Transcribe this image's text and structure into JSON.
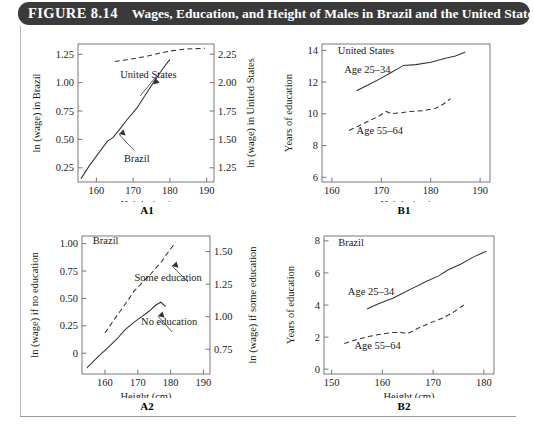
{
  "figure": {
    "number_label": "FIGURE 8.14",
    "caption": "Wages, Education, and Height of Males in Brazil and the United States"
  },
  "panels": {
    "a1": {
      "tag": "A1"
    },
    "b1": {
      "tag": "B1"
    },
    "a2": {
      "tag": "A2"
    },
    "b2": {
      "tag": "B2"
    }
  },
  "chart_data": [
    {
      "id": "A1",
      "type": "line",
      "title": "",
      "panel_label": "A1",
      "xlabel": "Height (cm)",
      "ylabel": "ln (wage) in Brazil",
      "y2label": "ln (wage) in United States",
      "xlim": [
        155,
        192
      ],
      "ylim": [
        0.125,
        1.34
      ],
      "y2lim": [
        1.125,
        2.34
      ],
      "xticks": [
        160,
        170,
        180,
        190
      ],
      "yticks": [
        0.25,
        0.5,
        0.75,
        1.0,
        1.25
      ],
      "ytick_labels": [
        "0.25",
        "0.50",
        "0.75",
        "1.00",
        "1.25"
      ],
      "y2ticks": [
        1.25,
        1.5,
        1.75,
        2.0,
        2.25
      ],
      "y2tick_labels": [
        "1.25",
        "1.50",
        "1.75",
        "2.00",
        "2.25"
      ],
      "grid": false,
      "legend_position": "inline-annotations",
      "annotations": [
        {
          "text": "United States",
          "x": 166.5,
          "y": 1.04,
          "axis": "left"
        },
        {
          "text": "Brazil",
          "x": 167.5,
          "y": 0.3,
          "axis": "left"
        }
      ],
      "series": [
        {
          "name": "Brazil",
          "axis": "left",
          "style": "solid",
          "x": [
            155.8,
            158.0,
            160.5,
            163.0,
            164.5,
            166.0,
            168.5,
            171.0,
            173.0,
            175.5,
            178.0,
            180.0
          ],
          "values": [
            0.155,
            0.265,
            0.375,
            0.485,
            0.515,
            0.575,
            0.68,
            0.775,
            0.875,
            1.0,
            1.12,
            1.205
          ]
        },
        {
          "name": "United States",
          "axis": "right",
          "style": "dashed",
          "x": [
            165.0,
            168.0,
            171.0,
            174.0,
            177.0,
            180.0,
            183.0,
            186.0,
            189.5
          ],
          "values": [
            2.185,
            2.2,
            2.215,
            2.235,
            2.258,
            2.278,
            2.292,
            2.298,
            2.302
          ]
        }
      ]
    },
    {
      "id": "B1",
      "type": "line",
      "panel_label": "B1",
      "country": "United States",
      "xlabel": "Height (cm)",
      "ylabel": "Years of education",
      "xlim": [
        158,
        192
      ],
      "ylim": [
        5.7,
        14.4
      ],
      "xticks": [
        160,
        170,
        180,
        190
      ],
      "yticks": [
        6,
        8,
        10,
        12,
        14
      ],
      "ytick_labels": [
        "6",
        "8",
        "10",
        "12",
        "14"
      ],
      "grid": false,
      "legend_position": "inline-annotations",
      "annotations": [
        {
          "text": "United States",
          "x": 161.2,
          "y": 13.75
        },
        {
          "text": "Age 25–34",
          "x": 162.5,
          "y": 12.55
        },
        {
          "text": "Age 55–64",
          "x": 165.0,
          "y": 8.75
        }
      ],
      "series": [
        {
          "name": "Age 25–34",
          "style": "solid",
          "x": [
            165.0,
            167.5,
            170.0,
            172.0,
            174.5,
            177.0,
            180.0,
            183.0,
            185.0,
            187.0
          ],
          "values": [
            11.45,
            11.85,
            12.25,
            12.6,
            13.05,
            13.1,
            13.25,
            13.5,
            13.65,
            13.9
          ]
        },
        {
          "name": "Age 55–64",
          "style": "dashed",
          "x": [
            163.5,
            165.5,
            167.5,
            169.5,
            171.0,
            172.0,
            173.5,
            176.0,
            178.5,
            181.0,
            182.5,
            184.0
          ],
          "values": [
            8.95,
            9.25,
            9.55,
            9.85,
            10.15,
            10.0,
            10.05,
            10.15,
            10.2,
            10.35,
            10.6,
            10.95
          ]
        }
      ]
    },
    {
      "id": "A2",
      "type": "line",
      "panel_label": "A2",
      "country": "Brazil",
      "xlabel": "Height (cm)",
      "ylabel": "ln (wage) if no education",
      "y2label": "ln (wage) if some education",
      "xlim": [
        153,
        192
      ],
      "ylim": [
        -0.19,
        1.07
      ],
      "y2lim": [
        0.56,
        1.62
      ],
      "xticks": [
        160,
        170,
        180,
        190
      ],
      "yticks": [
        0,
        0.25,
        0.5,
        0.75,
        1.0
      ],
      "ytick_labels": [
        "0",
        "0.25",
        "0.50",
        "0.75",
        "1.00"
      ],
      "y2ticks": [
        0.75,
        1.0,
        1.25,
        1.5
      ],
      "y2tick_labels": [
        "0.75",
        "1.00",
        "1.25",
        "1.50"
      ],
      "grid": false,
      "legend_position": "inline-annotations",
      "annotations": [
        {
          "text": "Brazil",
          "x": 156.3,
          "y": 1.0
        },
        {
          "text": "Some education",
          "x": 169.0,
          "y": 0.655
        },
        {
          "text": "No education",
          "x": 171.0,
          "y": 0.255
        }
      ],
      "series": [
        {
          "name": "No education",
          "axis": "left",
          "style": "solid",
          "x": [
            154.5,
            158.0,
            160.5,
            163.5,
            166.0,
            168.5,
            171.0,
            173.5,
            175.5,
            177.0,
            178.5
          ],
          "values": [
            -0.135,
            -0.03,
            0.04,
            0.125,
            0.21,
            0.275,
            0.33,
            0.385,
            0.44,
            0.465,
            0.425
          ]
        },
        {
          "name": "Some education",
          "axis": "right",
          "style": "dashed",
          "x": [
            160.0,
            163.0,
            166.0,
            169.0,
            171.5,
            174.0,
            177.0,
            179.5,
            181.5
          ],
          "values": [
            0.875,
            0.985,
            1.09,
            1.2,
            1.265,
            1.33,
            1.415,
            1.505,
            1.57
          ]
        }
      ]
    },
    {
      "id": "B2",
      "type": "line",
      "panel_label": "B2",
      "country": "Brazil",
      "xlabel": "Height (cm)",
      "ylabel": "Years of education",
      "xlim": [
        148.5,
        182
      ],
      "ylim": [
        -0.3,
        8.3
      ],
      "xticks": [
        150,
        160,
        170,
        180
      ],
      "yticks": [
        0,
        2,
        4,
        6,
        8
      ],
      "ytick_labels": [
        "0",
        "2",
        "4",
        "6",
        "8"
      ],
      "grid": false,
      "legend_position": "inline-annotations",
      "annotations": [
        {
          "text": "Brazil",
          "x": 151.3,
          "y": 7.7
        },
        {
          "text": "Age 25–34",
          "x": 153.2,
          "y": 4.65
        },
        {
          "text": "Age 55–64",
          "x": 154.5,
          "y": 1.25
        }
      ],
      "series": [
        {
          "name": "Age 25–34",
          "style": "solid",
          "x": [
            157.0,
            159.0,
            161.0,
            162.0,
            163.5,
            166.0,
            168.5,
            171.0,
            173.0,
            175.5,
            178.0,
            180.5
          ],
          "values": [
            3.75,
            4.05,
            4.3,
            4.4,
            4.65,
            5.05,
            5.45,
            5.8,
            6.2,
            6.55,
            7.0,
            7.35
          ]
        },
        {
          "name": "Age 55–64",
          "style": "dashed",
          "x": [
            152.5,
            155.0,
            157.5,
            160.0,
            162.0,
            163.5,
            165.0,
            167.0,
            169.5,
            172.0,
            174.0,
            176.5
          ],
          "values": [
            1.6,
            1.85,
            2.05,
            2.2,
            2.28,
            2.3,
            2.22,
            2.55,
            2.9,
            3.2,
            3.55,
            4.1
          ]
        }
      ]
    }
  ]
}
